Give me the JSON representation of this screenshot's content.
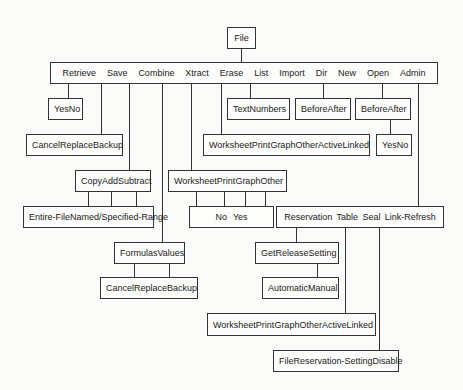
{
  "root": {
    "label": "File"
  },
  "menu": [
    "Retrieve",
    "Save",
    "Combine",
    "Xtract",
    "Erase",
    "List",
    "Import",
    "Dir",
    "New",
    "Open",
    "Admin"
  ],
  "retrieve_confirm": [
    "Yes",
    "No"
  ],
  "save_options": [
    "Cancel",
    "Replace",
    "Backup"
  ],
  "combine_ops": [
    "Copy",
    "Add",
    "Subtract"
  ],
  "combine_range": [
    "Entire-File",
    "Named/Specified-Range"
  ],
  "xtract_types": [
    "Formulas",
    "Values"
  ],
  "xtract_options": [
    "Cancel",
    "Replace",
    "Backup"
  ],
  "erase_types": [
    "Worksheet",
    "Print",
    "Graph",
    "Other"
  ],
  "erase_confirm": [
    "No",
    "Yes"
  ],
  "list_types": [
    "Worksheet",
    "Print",
    "Graph",
    "Other",
    "Active",
    "Linked"
  ],
  "import_types": [
    "Text",
    "Numbers"
  ],
  "new_position": [
    "Before",
    "After"
  ],
  "open_position": [
    "Before",
    "After"
  ],
  "open_confirm": [
    "Yes",
    "No"
  ],
  "admin_options": [
    "Reservation",
    "Table",
    "Seal",
    "Link-Refresh"
  ],
  "reservation_options": [
    "Get",
    "Release",
    "Setting"
  ],
  "reservation_setting": [
    "Automatic",
    "Manual"
  ],
  "table_types": [
    "Worksheet",
    "Print",
    "Graph",
    "Other",
    "Active",
    "Linked"
  ],
  "seal_options": [
    "File",
    "Reservation-Setting",
    "Disable"
  ]
}
